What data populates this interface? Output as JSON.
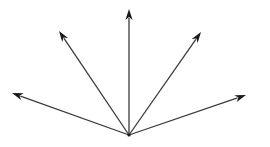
{
  "diagram": {
    "type": "vector-fan",
    "background": "#ffffff",
    "stroke_color": "#3a3a3a",
    "head_color": "#1a1a1a",
    "origin": {
      "x": 129,
      "y": 135
    },
    "arrows": [
      {
        "name": "arrow-left",
        "tip": {
          "x": 12,
          "y": 93
        }
      },
      {
        "name": "arrow-upper-left",
        "tip": {
          "x": 59,
          "y": 31
        }
      },
      {
        "name": "arrow-up",
        "tip": {
          "x": 129,
          "y": 9
        }
      },
      {
        "name": "arrow-upper-right",
        "tip": {
          "x": 201,
          "y": 32
        }
      },
      {
        "name": "arrow-right",
        "tip": {
          "x": 246,
          "y": 95
        }
      }
    ]
  }
}
